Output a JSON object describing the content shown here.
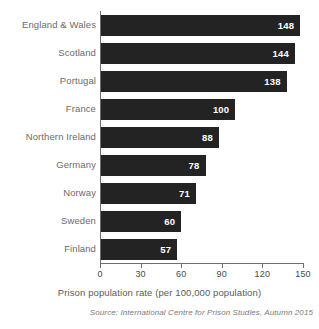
{
  "chart_data": {
    "type": "bar",
    "orientation": "horizontal",
    "title": "",
    "xlabel": "Prison population rate (per 100,000 population)",
    "ylabel": "",
    "xlim": [
      0,
      150
    ],
    "xticks": [
      0,
      30,
      60,
      90,
      120,
      150
    ],
    "grid": false,
    "legend": false,
    "bar_color": "#232323",
    "value_label_color": "#ffffff",
    "categories": [
      "England & Wales",
      "Scotland",
      "Portugal",
      "France",
      "Northern Ireland",
      "Germany",
      "Norway",
      "Sweden",
      "Finland"
    ],
    "values": [
      148,
      144,
      138,
      100,
      88,
      78,
      71,
      60,
      57
    ],
    "source": "Source: International Centre for Prison Studies, Autumn 2015"
  }
}
